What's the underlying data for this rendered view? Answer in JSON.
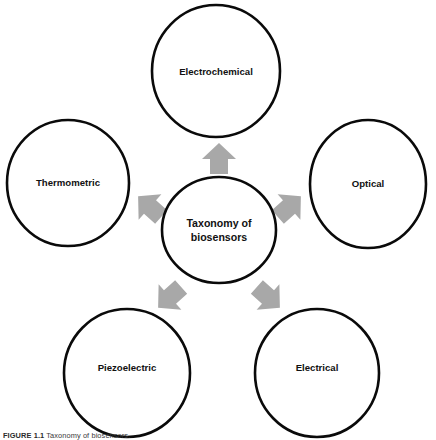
{
  "figure": {
    "type": "radial-taxonomy-diagram",
    "background_color": "#ffffff",
    "circle_fill": "#ffffff",
    "circle_stroke": "#0a0a0a",
    "arrow_color": "#a8a8a8",
    "text_color": "#111111",
    "caption_label": "FIGURE 1.1",
    "caption_text": "Taxonomy of biosensors."
  },
  "center": {
    "label_line1": "Taxonomy of",
    "label_line2": "biosensors",
    "cx": 219,
    "cy": 230,
    "rx": 57,
    "ry": 53
  },
  "nodes": [
    {
      "id": "electrochemical",
      "label": "Electrochemical",
      "position": "top",
      "cx": 216,
      "cy": 71,
      "rx": 64,
      "ry": 66,
      "label_x": 216,
      "label_y": 72
    },
    {
      "id": "optical",
      "label": "Optical",
      "position": "right",
      "cx": 368,
      "cy": 184,
      "rx": 58,
      "ry": 64,
      "label_x": 368,
      "label_y": 184
    },
    {
      "id": "thermometric",
      "label": "Thermometric",
      "position": "left",
      "cx": 68,
      "cy": 183,
      "rx": 61,
      "ry": 63,
      "label_x": 68,
      "label_y": 183
    },
    {
      "id": "piezoelectric",
      "label": "Piezoelectric",
      "position": "bottom-left",
      "cx": 127,
      "cy": 373,
      "rx": 63,
      "ry": 64,
      "label_x": 127,
      "label_y": 368
    },
    {
      "id": "electrical",
      "label": "Electrical",
      "position": "bottom-right",
      "cx": 317,
      "cy": 373,
      "rx": 62,
      "ry": 64,
      "label_x": 317,
      "label_y": 368
    }
  ],
  "arrows": [
    {
      "id": "arrow-to-electrochemical",
      "target": "electrochemical",
      "direction": "up",
      "angle_deg": 0,
      "tx": 219,
      "ty": 159
    },
    {
      "id": "arrow-to-optical",
      "target": "optical",
      "direction": "up-right",
      "angle_deg": 48,
      "tx": 289,
      "ty": 207
    },
    {
      "id": "arrow-to-thermometric",
      "target": "thermometric",
      "direction": "up-left",
      "angle_deg": -48,
      "tx": 150,
      "ty": 207
    },
    {
      "id": "arrow-to-piezoelectric",
      "target": "piezoelectric",
      "direction": "down-left",
      "angle_deg": -132,
      "tx": 170,
      "ty": 297
    },
    {
      "id": "arrow-to-electrical",
      "target": "electrical",
      "direction": "down-right",
      "angle_deg": 132,
      "tx": 268,
      "ty": 297
    }
  ]
}
